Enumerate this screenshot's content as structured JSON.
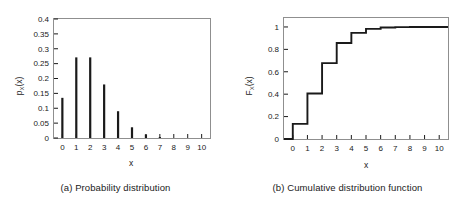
{
  "figure": {
    "panel_a": {
      "caption": "(a) Probability distribution",
      "xlabel": "x",
      "ylabel_main": "p",
      "ylabel_sub": "X",
      "ylabel_tail": "(x)"
    },
    "panel_b": {
      "caption": "(b) Cumulative distribution function",
      "xlabel": "x",
      "ylabel_main": "F",
      "ylabel_sub": "X",
      "ylabel_tail": "(x)"
    },
    "colors": {
      "line": "#1a1a1a",
      "frame": "#8a8a8a",
      "background": "#ffffff"
    }
  },
  "chart_data": [
    {
      "type": "bar",
      "title": "(a) Probability distribution",
      "xlabel": "x",
      "ylabel": "p_X(x)",
      "categories": [
        "0",
        "1",
        "2",
        "3",
        "4",
        "5",
        "6",
        "7",
        "8",
        "9",
        "10"
      ],
      "x": [
        0,
        1,
        2,
        3,
        4,
        5,
        6,
        7,
        8,
        9,
        10
      ],
      "values": [
        0.135,
        0.271,
        0.271,
        0.18,
        0.09,
        0.036,
        0.012,
        0.0034,
        0.0009,
        0.0002,
        0.0
      ],
      "xlim": [
        -0.6,
        10.6
      ],
      "ylim": [
        0,
        0.4
      ],
      "ytick_labels": [
        "0",
        "0.05",
        "0.1",
        "0.15",
        "0.2",
        "0.25",
        "0.3",
        "0.35",
        "0.4"
      ],
      "ytick_values": [
        0,
        0.05,
        0.1,
        0.15,
        0.2,
        0.25,
        0.3,
        0.35,
        0.4
      ],
      "xtick_labels": [
        "0",
        "1",
        "2",
        "3",
        "4",
        "5",
        "6",
        "7",
        "8",
        "9",
        "10"
      ],
      "grid": false,
      "legend": "none"
    },
    {
      "type": "line",
      "title": "(b) Cumulative distribution function",
      "xlabel": "x",
      "ylabel": "F_X(x)",
      "categories": [
        "0",
        "1",
        "2",
        "3",
        "4",
        "5",
        "6",
        "7",
        "8",
        "9",
        "10"
      ],
      "x": [
        0,
        1,
        2,
        3,
        4,
        5,
        6,
        7,
        8,
        9,
        10
      ],
      "values": [
        0.135,
        0.406,
        0.677,
        0.857,
        0.947,
        0.983,
        0.995,
        0.999,
        1.0,
        1.0,
        1.0
      ],
      "xlim": [
        -0.6,
        10.6
      ],
      "ylim": [
        0,
        1.08
      ],
      "ytick_labels": [
        "0",
        "0.2",
        "0.4",
        "0.6",
        "0.8",
        "1"
      ],
      "ytick_values": [
        0,
        0.2,
        0.4,
        0.6,
        0.8,
        1
      ],
      "xtick_labels": [
        "0",
        "1",
        "2",
        "3",
        "4",
        "5",
        "6",
        "7",
        "8",
        "9",
        "10"
      ],
      "grid": false,
      "legend": "none",
      "step_style": "post"
    }
  ]
}
